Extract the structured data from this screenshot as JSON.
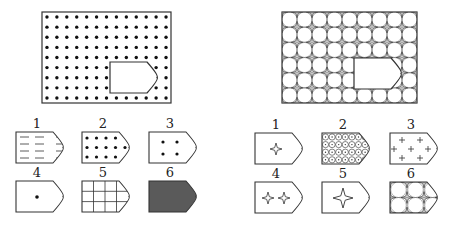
{
  "colors": {
    "stroke": "#333333",
    "dot": "#111111",
    "fill_dark": "#5a5a5a",
    "pattern_line": "#777777"
  },
  "left_puzzle": {
    "name": "dot-grid-puzzle",
    "main": {
      "x": 42,
      "y": 12,
      "w": 129,
      "h": 91,
      "pattern": "dots",
      "cols": 13,
      "rows": 9,
      "hole": {
        "x": 110,
        "y": 62,
        "w": 47,
        "h": 31
      }
    },
    "options": [
      {
        "label": "1",
        "x": 16,
        "y": 132,
        "pattern": "dashes"
      },
      {
        "label": "2",
        "x": 82,
        "y": 132,
        "pattern": "dots12"
      },
      {
        "label": "3",
        "x": 149,
        "y": 132,
        "pattern": "dots4"
      },
      {
        "label": "4",
        "x": 16,
        "y": 181,
        "pattern": "dot1"
      },
      {
        "label": "5",
        "x": 82,
        "y": 181,
        "pattern": "grid"
      },
      {
        "label": "6",
        "x": 149,
        "y": 181,
        "pattern": "solid"
      }
    ]
  },
  "right_puzzle": {
    "name": "star-lattice-puzzle",
    "main": {
      "x": 282,
      "y": 12,
      "w": 135,
      "h": 91,
      "pattern": "star-lattice",
      "cols": 9,
      "rows": 6,
      "hole": {
        "x": 354,
        "y": 58,
        "w": 47,
        "h": 31
      }
    },
    "options": [
      {
        "label": "1",
        "x": 255,
        "y": 133,
        "pattern": "star1-small"
      },
      {
        "label": "2",
        "x": 322,
        "y": 133,
        "pattern": "circles"
      },
      {
        "label": "3",
        "x": 390,
        "y": 133,
        "pattern": "crosses"
      },
      {
        "label": "4",
        "x": 255,
        "y": 182,
        "pattern": "star2"
      },
      {
        "label": "5",
        "x": 322,
        "y": 182,
        "pattern": "star1-large"
      },
      {
        "label": "6",
        "x": 390,
        "y": 182,
        "pattern": "star-lattice"
      }
    ]
  },
  "shape": {
    "w": 47,
    "h": 31,
    "notch": 10
  }
}
